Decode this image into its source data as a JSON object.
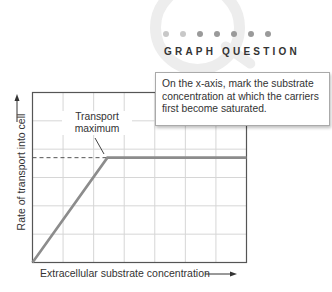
{
  "graph_question": {
    "heading": "GRAPH QUESTION",
    "dots": 7,
    "text": "On the x-axis, mark the substrate concentration at which the carriers first become saturated."
  },
  "chart_data": {
    "type": "line",
    "title": "",
    "xlabel": "Extracellular substrate concentration",
    "ylabel": "Rate of transport into cell",
    "x_axis_arrow": true,
    "y_axis_arrow": true,
    "grid": true,
    "grid_columns": 7,
    "grid_rows": 6,
    "tick_labels": false,
    "xlim": [
      0,
      7
    ],
    "ylim": [
      0,
      6
    ],
    "series": [
      {
        "name": "Rate of transport",
        "x": [
          0,
          2.45,
          7
        ],
        "y": [
          0,
          3.7,
          3.7
        ],
        "color": "#8c8c8c"
      }
    ],
    "reference_lines": [
      {
        "type": "horizontal",
        "y": 3.7,
        "x_from": 0,
        "x_to": 2.45,
        "style": "dashed",
        "label": "Transport maximum"
      }
    ],
    "annotations": [
      {
        "text": "Transport maximum",
        "points_to": [
          2.6,
          3.7
        ]
      }
    ]
  }
}
